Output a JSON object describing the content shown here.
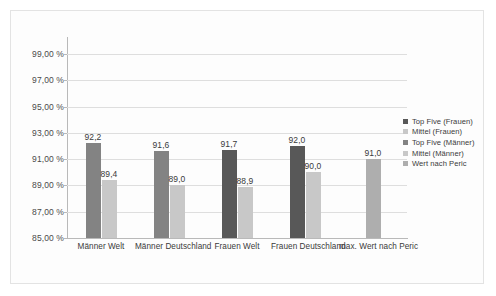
{
  "chart_data": {
    "type": "bar",
    "title": "",
    "subtitle": "",
    "xlabel": "",
    "ylabel": "",
    "ylim": [
      85.0,
      100.0
    ],
    "ytick_values": [
      85.0,
      87.0,
      89.0,
      91.0,
      93.0,
      95.0,
      97.0,
      99.0
    ],
    "ytick_labels": [
      "85,00 %",
      "87,00 %",
      "89,00 %",
      "91,00 %",
      "93,00 %",
      "95,00 %",
      "97,00 %",
      "99,00 %"
    ],
    "grid": true,
    "legend_position": "right",
    "categories": [
      "Männer Welt",
      "Männer Deutschland",
      "Frauen Welt",
      "Frauen Deutschland",
      "max. Wert nach Peric"
    ],
    "legend": [
      "Top Five (Frauen)",
      "Mittel (Frauen)",
      "Top Five (Männer)",
      "Mittel (Männer)",
      "Wert nach Peric"
    ],
    "legend_colors": [
      "#585858",
      "#c8c8c8",
      "#838383",
      "#c8c8c8",
      "#aeaeae"
    ],
    "series": [
      {
        "name": "Top Five (Männer)",
        "color": "#838383",
        "values": [
          92.2,
          91.6,
          null,
          null,
          null
        ],
        "labels": [
          "92,2",
          "91,6",
          "",
          "",
          ""
        ]
      },
      {
        "name": "Mittel (Männer)",
        "color": "#c8c8c8",
        "values": [
          89.4,
          89.0,
          null,
          null,
          null
        ],
        "labels": [
          "89,4",
          "89,0",
          "",
          "",
          ""
        ]
      },
      {
        "name": "Top Five (Frauen)",
        "color": "#585858",
        "values": [
          null,
          null,
          91.7,
          92.0,
          null
        ],
        "labels": [
          "",
          "",
          "91,7",
          "92,0",
          ""
        ]
      },
      {
        "name": "Mittel (Frauen)",
        "color": "#c8c8c8",
        "values": [
          null,
          null,
          88.9,
          90.0,
          null
        ],
        "labels": [
          "",
          "",
          "88,9",
          "90,0",
          ""
        ]
      },
      {
        "name": "Wert nach Peric",
        "color": "#aeaeae",
        "values": [
          null,
          null,
          null,
          null,
          91.0
        ],
        "labels": [
          "",
          "",
          "",
          "",
          "91,0"
        ]
      }
    ],
    "bars": [
      {
        "group": 0,
        "series": "Top Five (Männer)",
        "value": 92.2,
        "label": "92,2",
        "color": "#838383"
      },
      {
        "group": 0,
        "series": "Mittel (Männer)",
        "value": 89.4,
        "label": "89,4",
        "color": "#c8c8c8"
      },
      {
        "group": 1,
        "series": "Top Five (Männer)",
        "value": 91.6,
        "label": "91,6",
        "color": "#838383"
      },
      {
        "group": 1,
        "series": "Mittel (Männer)",
        "value": 89.0,
        "label": "89,0",
        "color": "#c8c8c8"
      },
      {
        "group": 2,
        "series": "Top Five (Frauen)",
        "value": 91.7,
        "label": "91,7",
        "color": "#585858"
      },
      {
        "group": 2,
        "series": "Mittel (Frauen)",
        "value": 88.9,
        "label": "88,9",
        "color": "#c8c8c8"
      },
      {
        "group": 3,
        "series": "Top Five (Frauen)",
        "value": 92.0,
        "label": "92,0",
        "color": "#585858"
      },
      {
        "group": 3,
        "series": "Mittel (Frauen)",
        "value": 90.0,
        "label": "90,0",
        "color": "#c8c8c8"
      },
      {
        "group": 4,
        "series": "Wert nach Peric",
        "value": 91.0,
        "label": "91,0",
        "color": "#aeaeae"
      }
    ]
  },
  "style": {
    "plot_background": "#ffffff",
    "frame_border": "#e3e3e3",
    "gridline_color": "#dedede",
    "axis_color": "#b9b9b9",
    "text_color": "#3a3a3a"
  }
}
